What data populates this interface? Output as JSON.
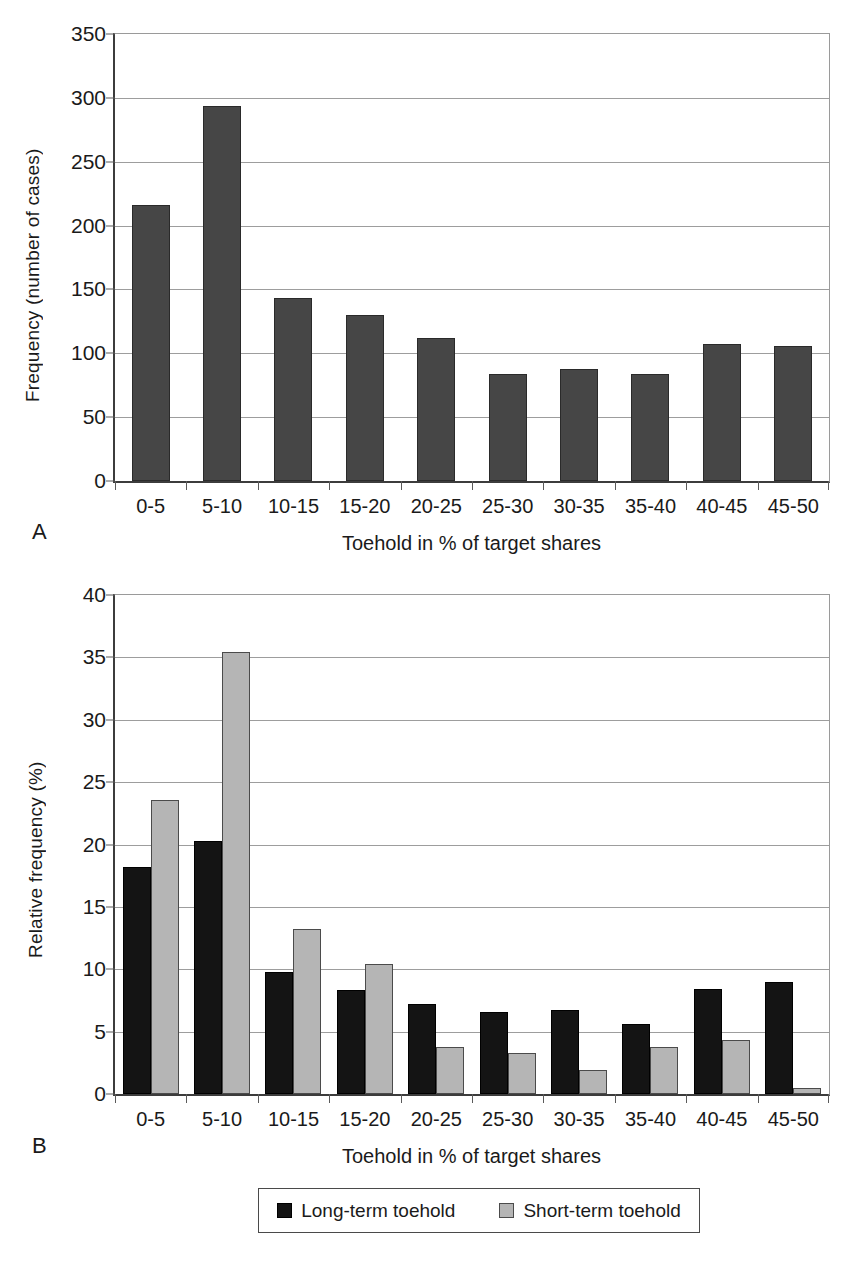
{
  "figure": {
    "panels": [
      {
        "letter": "A",
        "ylabel": "Frequency (number of cases)",
        "xlabel": "Toehold in % of target shares"
      },
      {
        "letter": "B",
        "ylabel": "Relative frequency (%)",
        "xlabel": "Toehold  in % of target shares"
      }
    ],
    "legend": {
      "items": [
        {
          "label": "Long-term toehold",
          "color": "#141414"
        },
        {
          "label": "Short-term toehold",
          "color": "#b5b5b5"
        }
      ]
    }
  },
  "chart_data": [
    {
      "type": "bar",
      "panel": "A",
      "title": "",
      "categories": [
        "0-5",
        "5-10",
        "10-15",
        "15-20",
        "20-25",
        "25-30",
        "30-35",
        "35-40",
        "40-45",
        "45-50"
      ],
      "values": [
        216,
        294,
        143,
        130,
        112,
        84,
        88,
        84,
        107,
        106
      ],
      "series": [
        {
          "name": "Frequency (number of cases)",
          "color": "#464646",
          "values": [
            216,
            294,
            143,
            130,
            112,
            84,
            88,
            84,
            107,
            106
          ]
        }
      ],
      "xlabel": "Toehold in % of target shares",
      "ylabel": "Frequency (number of cases)",
      "ylim": [
        0,
        350
      ],
      "yticks": [
        0,
        50,
        100,
        150,
        200,
        250,
        300,
        350
      ],
      "grid": true,
      "legend": "none"
    },
    {
      "type": "bar",
      "panel": "B",
      "title": "",
      "categories": [
        "0-5",
        "5-10",
        "10-15",
        "15-20",
        "20-25",
        "25-30",
        "30-35",
        "35-40",
        "40-45",
        "45-50"
      ],
      "series": [
        {
          "name": "Long-term toehold",
          "color": "#141414",
          "values": [
            18.2,
            20.3,
            9.8,
            8.3,
            7.2,
            6.6,
            6.7,
            5.6,
            8.4,
            9.0
          ]
        },
        {
          "name": "Short-term toehold",
          "color": "#b5b5b5",
          "values": [
            23.6,
            35.4,
            13.2,
            10.4,
            3.8,
            3.3,
            1.9,
            3.8,
            4.3,
            0.5
          ]
        }
      ],
      "xlabel": "Toehold  in % of target shares",
      "ylabel": "Relative frequency (%)",
      "ylim": [
        0,
        40
      ],
      "yticks": [
        0,
        5,
        10,
        15,
        20,
        25,
        30,
        35,
        40
      ],
      "grid": true,
      "legend": "bottom-center"
    }
  ]
}
